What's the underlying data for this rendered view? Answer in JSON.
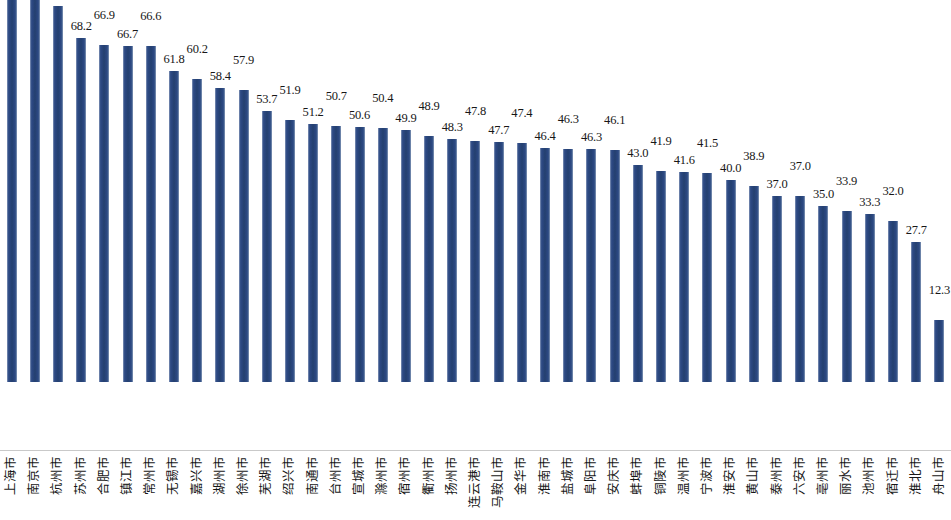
{
  "chart_data": {
    "type": "bar",
    "title": "",
    "subtitle": "",
    "xlabel": "",
    "ylabel": "",
    "ylim": [
      0,
      100
    ],
    "grid": false,
    "legend": null,
    "bar_color": "#2e4b83",
    "background_color": "#ffffff",
    "baseline_color": "#c9c9c9",
    "label_rotation": -90,
    "data_labels": true,
    "data_label_alternating": true,
    "categories": [
      "上海市",
      "南京市",
      "杭州市",
      "苏州市",
      "合肥市",
      "镇江市",
      "常州市",
      "无锡市",
      "嘉兴市",
      "湖州市",
      "徐州市",
      "芜湖市",
      "绍兴市",
      "南通市",
      "台州市",
      "宣城市",
      "滁州市",
      "宿州市",
      "衢州市",
      "扬州市",
      "连云港市",
      "马鞍山市",
      "金华市",
      "淮南市",
      "盐城市",
      "阜阳市",
      "安庆市",
      "蚌埠市",
      "铜陵市",
      "温州市",
      "宁波市",
      "淮安市",
      "黄山市",
      "泰州市",
      "六安市",
      "亳州市",
      "丽水市",
      "池州市",
      "宿迁市",
      "淮北市",
      "舟山市"
    ],
    "values": [
      86.5,
      85.3,
      74.6,
      68.2,
      66.9,
      66.7,
      66.6,
      61.8,
      60.2,
      58.4,
      57.9,
      53.7,
      51.9,
      51.2,
      50.7,
      50.6,
      50.4,
      49.9,
      48.9,
      48.3,
      47.8,
      47.7,
      47.4,
      46.4,
      46.3,
      46.3,
      46.1,
      43.0,
      41.9,
      41.6,
      41.5,
      40.0,
      38.9,
      37.0,
      37.0,
      35.0,
      33.9,
      33.3,
      32.0,
      27.7,
      12.3
    ]
  }
}
